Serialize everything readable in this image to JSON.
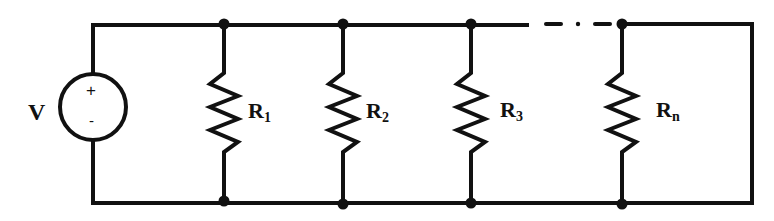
{
  "diagram": {
    "type": "parallel-resistor-circuit",
    "source": {
      "label": "V",
      "plus": "+",
      "minus": "-"
    },
    "resistors": [
      {
        "label": "R",
        "subscript": "1"
      },
      {
        "label": "R",
        "subscript": "2"
      },
      {
        "label": "R",
        "subscript": "3"
      },
      {
        "label": "R",
        "subscript": "n"
      }
    ],
    "ellipsis_between": [
      "R3",
      "Rn"
    ],
    "colors": {
      "stroke": "#111111",
      "background": "#ffffff"
    }
  }
}
